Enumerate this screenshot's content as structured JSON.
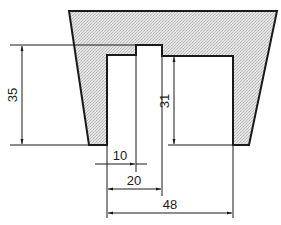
{
  "drawing": {
    "type": "technical-cross-section",
    "fill_color": "#d9d9d9",
    "line_color": "#1a1a1a",
    "background": "#ffffff",
    "dimensions": {
      "outer_depth": "35",
      "inner_depth": "31",
      "pin_width": "10",
      "inner_half_width": "20",
      "bore_width": "48"
    }
  }
}
